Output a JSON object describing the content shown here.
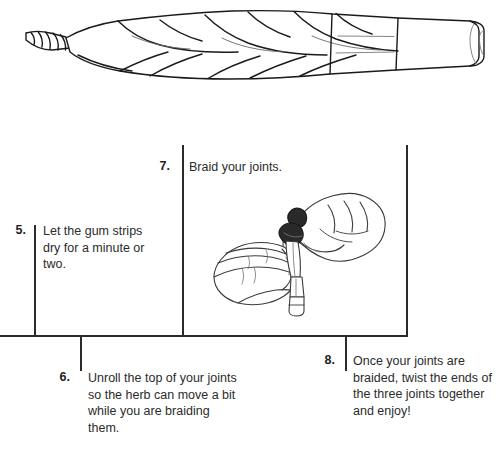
{
  "page": {
    "background_color": "#ffffff",
    "ink_color": "#2b2b2b"
  },
  "top_illustration": {
    "name": "braided-joint-illustration",
    "caption": "",
    "description": "Line drawing of three joints braided together, twisted tip at left, open end at right"
  },
  "diagram": {
    "hands_illustration": {
      "name": "hands-braiding-joints-illustration",
      "description": "Line drawing of two hands braiding three joints together"
    },
    "steps": [
      {
        "number": "5.",
        "text": "Let the gum strips dry for a minute or two."
      },
      {
        "number": "6.",
        "text": "Unroll the top of your joints so the herb can move a bit while you are braiding them."
      },
      {
        "number": "7.",
        "text": "Braid your joints."
      },
      {
        "number": "8.",
        "text": "Once your joints are braided, twist the ends of the three joints together and enjoy!"
      }
    ]
  }
}
